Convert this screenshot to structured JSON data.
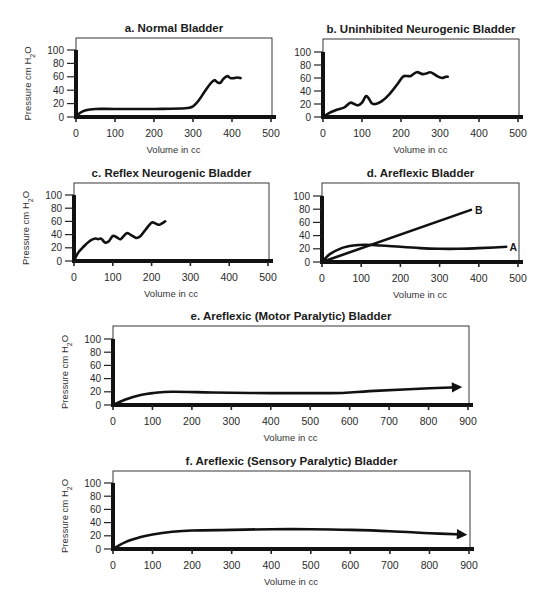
{
  "figure": {
    "panels": [
      "a",
      "b",
      "c",
      "d",
      "e",
      "f"
    ]
  },
  "chart_data": [
    {
      "id": "a",
      "type": "line",
      "title": "a.  Normal Bladder",
      "xlabel": "Volume in cc",
      "ylabel": "Pressure  cm H2O",
      "xlim": [
        0,
        500
      ],
      "ylim": [
        0,
        100
      ],
      "xticks": [
        0,
        100,
        200,
        300,
        400,
        500
      ],
      "yticks": [
        0,
        20,
        40,
        60,
        80,
        100
      ],
      "grid": false,
      "layout": {
        "x0": 76,
        "x1": 271,
        "y0": 117,
        "y100": 50,
        "frameTop": 38,
        "frameRight": 272
      },
      "series": [
        {
          "name": "Normal",
          "x": [
            0,
            10,
            25,
            50,
            100,
            200,
            280,
            300,
            315,
            330,
            345,
            355,
            362,
            370,
            378,
            388,
            396,
            405,
            415,
            422
          ],
          "y": [
            0,
            6,
            10,
            12,
            12,
            12,
            13,
            16,
            25,
            38,
            50,
            55,
            52,
            51,
            57,
            61,
            58,
            58,
            59,
            58
          ]
        }
      ]
    },
    {
      "id": "b",
      "type": "line",
      "title": "b.  Uninhibited Neurogenic Bladder",
      "xlabel": "Volume in cc",
      "ylabel": "",
      "xlim": [
        0,
        500
      ],
      "ylim": [
        0,
        100
      ],
      "xticks": [
        0,
        100,
        200,
        300,
        400,
        500
      ],
      "yticks": [
        0,
        20,
        40,
        60,
        80,
        100
      ],
      "grid": false,
      "layout": {
        "x0": 323,
        "x1": 518,
        "y0": 117,
        "y100": 52,
        "frameTop": 39,
        "frameRight": 519
      },
      "series": [
        {
          "name": "Uninhibited",
          "x": [
            0,
            15,
            35,
            55,
            70,
            80,
            90,
            100,
            110,
            118,
            125,
            135,
            150,
            170,
            190,
            205,
            215,
            225,
            240,
            255,
            265,
            275,
            285,
            295,
            305,
            315,
            320
          ],
          "y": [
            0,
            6,
            11,
            15,
            22,
            20,
            18,
            22,
            32,
            28,
            21,
            20,
            24,
            35,
            50,
            62,
            63,
            63,
            69,
            66,
            67,
            69,
            66,
            62,
            60,
            62,
            62
          ]
        }
      ]
    },
    {
      "id": "c",
      "type": "line",
      "title": "c.  Reflex Neurogenic Bladder",
      "xlabel": "Volume in cc",
      "ylabel": "Pressure  cm H2O",
      "xlim": [
        0,
        500
      ],
      "ylim": [
        0,
        100
      ],
      "xticks": [
        0,
        100,
        200,
        300,
        400,
        500
      ],
      "yticks": [
        0,
        20,
        40,
        60,
        80,
        100
      ],
      "grid": false,
      "layout": {
        "x0": 74,
        "x1": 268,
        "y0": 261,
        "y100": 195,
        "frameTop": 183,
        "frameRight": 269
      },
      "series": [
        {
          "name": "Reflex",
          "x": [
            0,
            10,
            25,
            40,
            55,
            62,
            70,
            80,
            90,
            100,
            110,
            120,
            135,
            145,
            160,
            170,
            185,
            200,
            210,
            220,
            235
          ],
          "y": [
            0,
            12,
            22,
            30,
            34,
            33,
            34,
            28,
            30,
            38,
            36,
            33,
            42,
            40,
            35,
            37,
            48,
            58,
            57,
            55,
            60
          ]
        }
      ]
    },
    {
      "id": "d",
      "type": "line",
      "title": "d. Areflexic Bladder",
      "xlabel": "Volume in cc",
      "ylabel": "",
      "xlim": [
        0,
        500
      ],
      "ylim": [
        0,
        100
      ],
      "xticks": [
        0,
        100,
        200,
        300,
        400,
        500
      ],
      "yticks": [
        0,
        20,
        40,
        60,
        80,
        100
      ],
      "grid": false,
      "layout": {
        "x0": 322,
        "x1": 518,
        "y0": 262,
        "y100": 196,
        "frameTop": 183,
        "frameRight": 519
      },
      "series": [
        {
          "name": "A",
          "x": [
            0,
            20,
            50,
            80,
            110,
            150,
            200,
            250,
            300,
            350,
            400,
            440,
            470
          ],
          "y": [
            0,
            12,
            21,
            25,
            26,
            25,
            23,
            21,
            20,
            20,
            21,
            22,
            23
          ]
        },
        {
          "name": "B",
          "x": [
            0,
            380
          ],
          "y": [
            0,
            79
          ]
        }
      ],
      "annotations": [
        {
          "text": "B",
          "x": 390,
          "y": 79
        },
        {
          "text": "A",
          "x": 478,
          "y": 22
        }
      ]
    },
    {
      "id": "e",
      "type": "line",
      "title": "e. Areflexic (Motor Paralytic) Bladder",
      "xlabel": "Volume in cc",
      "ylabel": "Pressure  cm H2O",
      "xlim": [
        0,
        900
      ],
      "ylim": [
        0,
        100
      ],
      "xticks": [
        0,
        100,
        200,
        300,
        400,
        500,
        600,
        700,
        800,
        900
      ],
      "yticks": [
        0,
        20,
        40,
        60,
        80,
        100
      ],
      "grid": false,
      "layout": {
        "x0": 113,
        "x1": 468,
        "y0": 405,
        "y100": 339,
        "frameTop": 326,
        "frameRight": 469
      },
      "series": [
        {
          "name": "Motor Paralytic",
          "arrow": true,
          "x": [
            0,
            30,
            70,
            100,
            150,
            250,
            400,
            550,
            600,
            650,
            750,
            875
          ],
          "y": [
            0,
            8,
            15,
            18,
            20,
            19,
            18,
            18,
            19,
            21,
            24,
            27
          ]
        }
      ]
    },
    {
      "id": "f",
      "type": "line",
      "title": "f. Areflexic (Sensory Paralytic) Bladder",
      "xlabel": "Volume in cc",
      "ylabel": "Pressure  cm H2O",
      "xlim": [
        0,
        900
      ],
      "ylim": [
        0,
        100
      ],
      "xticks": [
        0,
        100,
        200,
        300,
        400,
        500,
        600,
        700,
        800,
        900
      ],
      "yticks": [
        0,
        20,
        40,
        60,
        80,
        100
      ],
      "grid": false,
      "layout": {
        "x0": 113,
        "x1": 469,
        "y0": 549,
        "y100": 483,
        "frameTop": 471,
        "frameRight": 470
      },
      "series": [
        {
          "name": "Sensory Paralytic",
          "arrow": true,
          "x": [
            0,
            30,
            70,
            100,
            150,
            200,
            300,
            400,
            500,
            600,
            700,
            800,
            885
          ],
          "y": [
            0,
            10,
            18,
            22,
            26,
            28,
            29,
            30,
            30,
            29,
            27,
            24,
            22
          ]
        }
      ]
    }
  ]
}
